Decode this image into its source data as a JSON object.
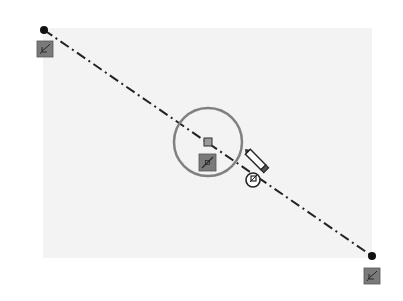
{
  "sketch": {
    "line": {
      "type": "centerline",
      "start": {
        "x": 44,
        "y": 30
      },
      "end": {
        "x": 372,
        "y": 256
      },
      "color": "#222222"
    },
    "midpoint_circle": {
      "cx": 208,
      "cy": 142,
      "r": 34,
      "color": "#7a7a7a"
    },
    "midpoint_marker": {
      "x": 208,
      "y": 142
    },
    "relations": [
      {
        "name": "endpoint-start-relation",
        "icon": "coincident-relation-icon"
      },
      {
        "name": "midpoint-relation",
        "icon": "midpoint-relation-icon"
      },
      {
        "name": "endpoint-end-relation",
        "icon": "coincident-relation-icon"
      }
    ],
    "cursor": {
      "icon": "pencil-icon",
      "badge": "coincident-badge-icon"
    },
    "colors": {
      "background": "#ffffff",
      "panel": "#f3f3f3",
      "relation_icon_bg": "#777777"
    }
  }
}
